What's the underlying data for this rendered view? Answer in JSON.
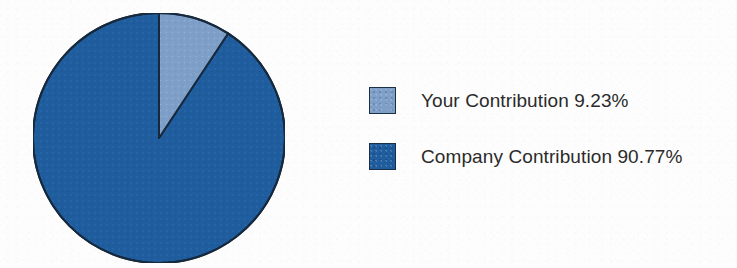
{
  "page": {
    "background_color": "#fdfdfd",
    "width": 737,
    "height": 268
  },
  "chart_data": {
    "type": "pie",
    "title": "",
    "labels": [
      "Your Contribution",
      "Company Contribution"
    ],
    "values": [
      9.23,
      90.77
    ],
    "value_unit": "%",
    "colors": [
      "#7e9fc8",
      "#1f5d9e"
    ],
    "slice_outline_color": "#16293d",
    "start_angle_deg": 0,
    "direction": "clockwise",
    "legend_position": "right",
    "grid": false,
    "slices": [
      {
        "name": "Your Contribution",
        "value": 9.23,
        "display_value": "9.23%",
        "legend_text": "Your Contribution 9.23%",
        "color": "#7e9fc8",
        "sweep_deg": 33.2
      },
      {
        "name": "Company Contribution",
        "value": 90.77,
        "display_value": "90.77%",
        "legend_text": "Company Contribution 90.77%",
        "color": "#1f5d9e",
        "sweep_deg": 326.8
      }
    ]
  },
  "legend": {
    "items": [
      {
        "label": "Your Contribution 9.23%",
        "color": "#7e9fc8",
        "swatch_name": "legend-swatch-your-contribution"
      },
      {
        "label": "Company Contribution 90.77%",
        "color": "#1f5d9e",
        "swatch_name": "legend-swatch-company-contribution"
      }
    ]
  }
}
